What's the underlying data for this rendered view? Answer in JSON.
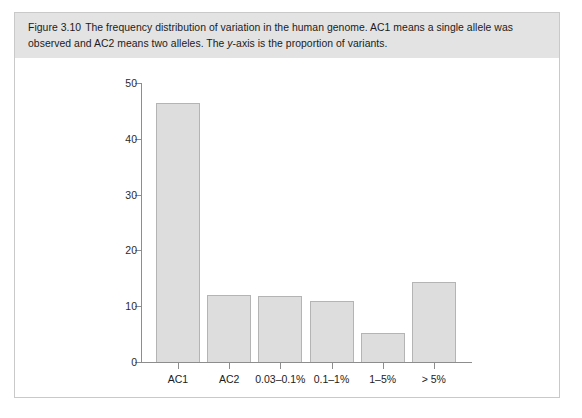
{
  "figure": {
    "caption": {
      "figure_number": "Figure 3.10",
      "line1_a": "The frequency distribution of variation in the human genome. AC1 means a single allele was observed",
      "line2_a": "and AC2 means two alleles. The ",
      "line2_italic": "y",
      "line2_b": "-axis is the proportion of variants."
    }
  },
  "chart_data": {
    "type": "bar",
    "title": "",
    "xlabel": "",
    "ylabel": "",
    "categories": [
      "AC1",
      "AC2",
      "0.03–0.1%",
      "0.1–1%",
      "1–5%",
      "> 5%"
    ],
    "values": [
      46.5,
      12.0,
      11.9,
      10.9,
      5.2,
      14.3
    ],
    "ylim": [
      0,
      50
    ],
    "yticks": [
      0,
      10,
      20,
      30,
      40,
      50
    ],
    "ytick_labels": [
      "0",
      "10",
      "20",
      "30",
      "40",
      "50"
    ],
    "grid": false,
    "legend": false,
    "colors": {
      "bar_fill": "#dddddd",
      "bar_stroke": "#b4b4b4",
      "axis": "#8d8d8d",
      "caption_band": "#e3e3e3",
      "panel_border": "#c9c9c9",
      "text": "#1b1b1b"
    }
  }
}
